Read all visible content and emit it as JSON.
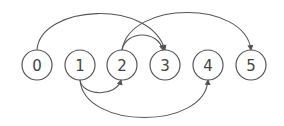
{
  "diagram": {
    "type": "directed-graph",
    "nodes": [
      {
        "id": "0",
        "label": "0",
        "x": 37,
        "y": 65
      },
      {
        "id": "1",
        "label": "1",
        "x": 80,
        "y": 65
      },
      {
        "id": "2",
        "label": "2",
        "x": 122,
        "y": 65
      },
      {
        "id": "3",
        "label": "3",
        "x": 165,
        "y": 65
      },
      {
        "id": "4",
        "label": "4",
        "x": 208,
        "y": 65
      },
      {
        "id": "5",
        "label": "5",
        "x": 251,
        "y": 65
      }
    ],
    "edges": [
      {
        "from": "0",
        "to": "3",
        "side": "top"
      },
      {
        "from": "2",
        "to": "3",
        "side": "top"
      },
      {
        "from": "2",
        "to": "5",
        "side": "top"
      },
      {
        "from": "1",
        "to": "2",
        "side": "bottom"
      },
      {
        "from": "1",
        "to": "4",
        "side": "bottom"
      }
    ],
    "colors": {
      "stroke": "#555555",
      "text": "#444444",
      "background": "#ffffff"
    }
  }
}
